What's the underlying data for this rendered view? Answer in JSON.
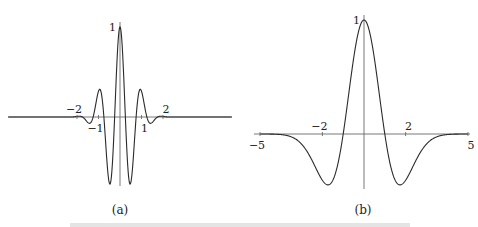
{
  "chart_data": [
    {
      "type": "line",
      "panel_label": "(a)",
      "title": "",
      "xlabel": "",
      "ylabel": "",
      "function": "cos(2*pi*x) * exp(-x^2 / 0.8)",
      "xlim": [
        -5.5,
        5.5
      ],
      "ylim": [
        -0.75,
        1
      ],
      "grid": false,
      "x_ticks": [
        {
          "value": -2,
          "label": "−2",
          "side": "above"
        },
        {
          "value": -1,
          "label": "−1",
          "side": "below"
        },
        {
          "value": 1,
          "label": "1",
          "side": "below"
        },
        {
          "value": 2,
          "label": "2",
          "side": "above"
        }
      ],
      "y_ticks": [
        {
          "value": 1,
          "label": "1"
        }
      ],
      "key_points": [
        {
          "x": 0,
          "y": 1
        },
        {
          "x": -0.5,
          "y": -0.73
        },
        {
          "x": 0.5,
          "y": -0.73
        },
        {
          "x": -1.0,
          "y": 0.29
        },
        {
          "x": 1.0,
          "y": 0.29
        },
        {
          "x": -1.5,
          "y": -0.06
        },
        {
          "x": 1.5,
          "y": -0.06
        }
      ]
    },
    {
      "type": "line",
      "panel_label": "(b)",
      "title": "",
      "xlabel": "",
      "ylabel": "",
      "function": "(1 - x^2) * exp(-x^2 / 2)",
      "xlim": [
        -5,
        5
      ],
      "ylim": [
        -0.45,
        1
      ],
      "grid": false,
      "x_ticks": [
        {
          "value": -5,
          "label": "−5",
          "side": "below"
        },
        {
          "value": -2,
          "label": "−2",
          "side": "above"
        },
        {
          "value": 2,
          "label": "2",
          "side": "above"
        },
        {
          "value": 5,
          "label": "5",
          "side": "below"
        }
      ],
      "y_ticks": [
        {
          "value": 1,
          "label": "1"
        }
      ],
      "key_points": [
        {
          "x": 0,
          "y": 1
        },
        {
          "x": -1.73,
          "y": -0.446
        },
        {
          "x": 1.73,
          "y": -0.446
        },
        {
          "x": -1,
          "y": 0
        },
        {
          "x": 1,
          "y": 0
        }
      ]
    }
  ],
  "caption_fragment": "Figure ..."
}
